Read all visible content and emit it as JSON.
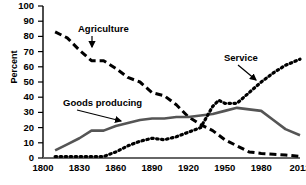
{
  "chart_data": {
    "type": "line",
    "title": "",
    "xlabel": "",
    "ylabel": "Percent",
    "xlim": [
      1800,
      2012
    ],
    "ylim": [
      0,
      100
    ],
    "grid": false,
    "legend_position": "inline-annotations",
    "xticks": [
      "1800",
      "1830",
      "1860",
      "1890",
      "1920",
      "1950",
      "1980",
      "2012"
    ],
    "xtick_values": [
      1800,
      1830,
      1860,
      1890,
      1920,
      1950,
      1980,
      2012
    ],
    "yticks": [
      "0",
      "10",
      "20",
      "30",
      "40",
      "50",
      "60",
      "70",
      "80",
      "90",
      "100"
    ],
    "ytick_values": [
      0,
      10,
      20,
      30,
      40,
      50,
      60,
      70,
      80,
      90,
      100
    ],
    "series": [
      {
        "name": "Agriculture",
        "style": "dashed",
        "color": "#000000",
        "x": [
          1810,
          1820,
          1830,
          1840,
          1850,
          1860,
          1870,
          1880,
          1890,
          1900,
          1910,
          1920,
          1930,
          1940,
          1950,
          1960,
          1970,
          1980,
          1990,
          2000,
          2012
        ],
        "values": [
          83,
          79,
          71,
          64,
          64,
          59,
          53,
          50,
          43,
          41,
          35,
          27,
          22,
          18,
          12,
          8,
          4,
          3,
          2.5,
          2,
          1
        ]
      },
      {
        "name": "Goods producing",
        "style": "solid",
        "color": "#555555",
        "x": [
          1810,
          1820,
          1830,
          1840,
          1850,
          1860,
          1870,
          1880,
          1890,
          1900,
          1910,
          1920,
          1930,
          1940,
          1950,
          1960,
          1970,
          1980,
          1990,
          2000,
          2012
        ],
        "values": [
          5,
          9,
          13,
          18,
          18,
          21,
          23,
          25,
          26,
          26,
          27,
          27,
          28,
          29,
          31,
          33,
          32,
          31,
          25,
          19,
          15
        ]
      },
      {
        "name": "Service",
        "style": "dotted",
        "color": "#000000",
        "x": [
          1810,
          1820,
          1830,
          1840,
          1850,
          1860,
          1870,
          1880,
          1890,
          1900,
          1910,
          1920,
          1930,
          1940,
          1945,
          1950,
          1960,
          1970,
          1980,
          1990,
          2000,
          2012
        ],
        "values": [
          1,
          1,
          1,
          1,
          1,
          4,
          8,
          11,
          13,
          12,
          14,
          17,
          20,
          34,
          38,
          36,
          36,
          43,
          50,
          56,
          61,
          65
        ]
      }
    ],
    "annotations": [
      {
        "label": "Agriculture",
        "x_px": 78,
        "y_px": 23,
        "arrow_to_x": 92,
        "arrow_to_y": 47
      },
      {
        "label": "Goods producing",
        "x_px": 63,
        "y_px": 97,
        "arrow_to_x": 121,
        "arrow_to_y": 121
      },
      {
        "label": "Service",
        "x_px": 224,
        "y_px": 52,
        "arrow_to_x": 256,
        "arrow_to_y": 80
      }
    ]
  }
}
